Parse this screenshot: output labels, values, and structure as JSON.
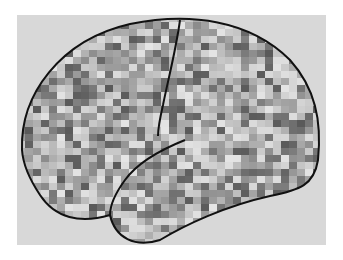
{
  "figure": {
    "colors": {
      "page_background": "#ffffff",
      "panel_background": "#d8d8d8",
      "outline": "#111111",
      "mosaic_dark": "#5a5a5a",
      "mosaic_light": "#e6e6e6"
    },
    "labels": []
  }
}
